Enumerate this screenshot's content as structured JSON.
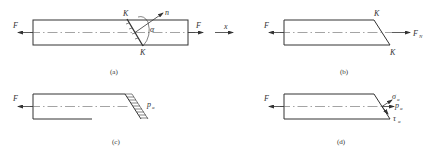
{
  "figure": {
    "panels": [
      {
        "id": "a",
        "caption": "(a)",
        "labels": {
          "left_force": "F",
          "right_force": "F",
          "axis": "x",
          "section_top": "K",
          "section_bottom": "K",
          "normal": "n",
          "angle": "α"
        }
      },
      {
        "id": "b",
        "caption": "(b)",
        "labels": {
          "left_force": "F",
          "right_force": "F",
          "right_force_sub": "N",
          "section_top": "K",
          "section_bottom": "K"
        }
      },
      {
        "id": "c",
        "caption": "(c)",
        "labels": {
          "left_force": "F",
          "stress": "p",
          "stress_sub": "α"
        }
      },
      {
        "id": "d",
        "caption": "(d)",
        "labels": {
          "left_force": "F",
          "normal_stress": "σ",
          "normal_stress_sub": "α",
          "total_stress": "p",
          "total_stress_sub": "α",
          "shear_stress": "τ",
          "shear_stress_sub": "α"
        }
      }
    ]
  }
}
